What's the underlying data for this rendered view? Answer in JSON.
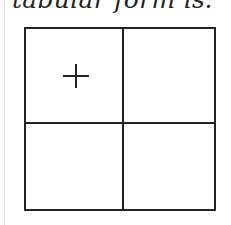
{
  "caption": "tabular form is:",
  "table": {
    "rows": 2,
    "cols": 2,
    "cells": [
      [
        "+",
        ""
      ],
      [
        "",
        ""
      ]
    ]
  }
}
